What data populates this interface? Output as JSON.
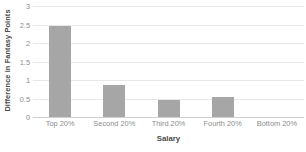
{
  "chart_data": {
    "type": "bar",
    "title": "",
    "subtitle": "",
    "xlabel": "Salary",
    "ylabel": "Difference in Fantasy Points",
    "categories": [
      "Top 20%",
      "Second 20%",
      "Third 20%",
      "Fourth 20%",
      "Bottom 20%"
    ],
    "values": [
      2.45,
      0.87,
      0.46,
      0.54,
      0
    ],
    "ylim": [
      0,
      3
    ],
    "yticks": [
      0,
      0.5,
      1,
      1.5,
      2,
      2.5,
      3
    ],
    "ytick_labels": [
      "0",
      "0.5",
      "1",
      "1.5",
      "2",
      "2.5",
      "3"
    ],
    "grid": true,
    "grid_axis": "y",
    "legend": false,
    "legend_position": "none",
    "bar_color": "#a6a6a6",
    "gridline_color": "#e8e8e8",
    "axis_line_color": "#d0d0d0",
    "tick_label_color": "#8c8c8c",
    "axis_title_color": "#4a4a4a",
    "background_color": "#ffffff"
  }
}
